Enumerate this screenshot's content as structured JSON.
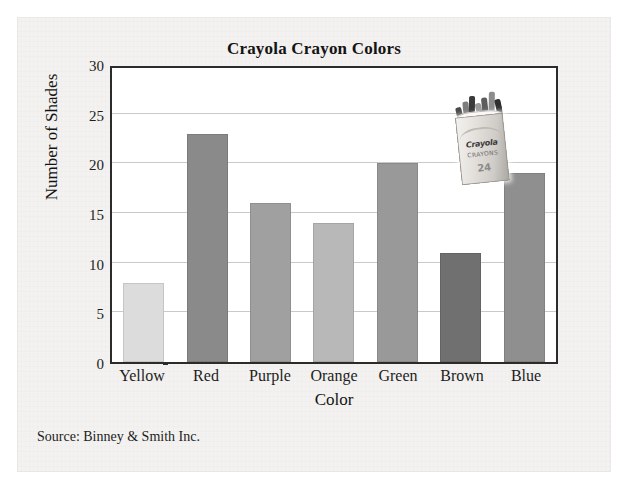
{
  "figure": {
    "title": "Crayola Crayon Colors",
    "source_note": "Source: Binney & Smith Inc.",
    "y_axis_title": "Number of Shades",
    "x_axis_title": "Color"
  },
  "photo": {
    "name": "crayola-crayon-box",
    "brand": "Crayola",
    "subtitle": "CRAYONS",
    "count": "24"
  },
  "chart_data": {
    "type": "bar",
    "title": "Crayola Crayon Colors",
    "xlabel": "Color",
    "ylabel": "Number of Shades",
    "categories": [
      "Yellow",
      "Red",
      "Purple",
      "Orange",
      "Green",
      "Brown",
      "Blue"
    ],
    "values": [
      8,
      23,
      16,
      14,
      20,
      11,
      19
    ],
    "bar_colors": [
      "#dcdcdc",
      "#8a8a8a",
      "#a0a0a0",
      "#b8b8b8",
      "#999999",
      "#707070",
      "#8f8f8f"
    ],
    "ylim": [
      0,
      30
    ],
    "yticks": [
      0,
      5,
      10,
      15,
      20,
      25,
      30
    ],
    "ytick_labels": [
      "0",
      "5",
      "10",
      "15",
      "20",
      "25",
      "30"
    ],
    "grid": true,
    "grid_axis": "y",
    "legend": false,
    "annotations": [
      "Source: Binney & Smith Inc."
    ]
  }
}
